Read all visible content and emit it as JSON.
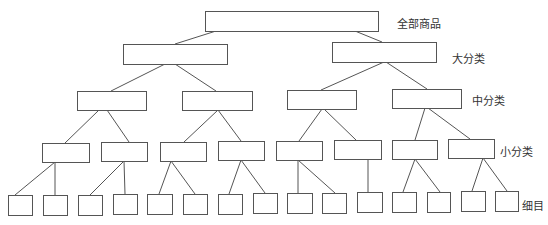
{
  "diagram": {
    "type": "tree",
    "colors": {
      "stroke": "#555555",
      "background": "#ffffff",
      "text": "#333333"
    },
    "levels": [
      {
        "label": "全部商品",
        "label_pos": [
          397,
          15
        ]
      },
      {
        "label": "大分类",
        "label_pos": [
          452,
          50
        ]
      },
      {
        "label": "中分类",
        "label_pos": [
          472,
          92
        ]
      },
      {
        "label": "小分类",
        "label_pos": [
          500,
          143
        ]
      },
      {
        "label": "细目",
        "label_pos": [
          522,
          197
        ]
      }
    ],
    "nodes": {
      "level0": [
        [
          205,
          11,
          173,
          20
        ]
      ],
      "level1": [
        [
          123,
          44,
          104,
          20
        ],
        [
          332,
          42,
          104,
          20
        ]
      ],
      "level2": [
        [
          77,
          91,
          69,
          19
        ],
        [
          182,
          91,
          70,
          19
        ],
        [
          287,
          90,
          69,
          19
        ],
        [
          392,
          89,
          69,
          19
        ]
      ],
      "level3": [
        [
          42,
          143,
          47,
          19
        ],
        [
          101,
          142,
          46,
          19
        ],
        [
          160,
          142,
          46,
          19
        ],
        [
          218,
          141,
          46,
          19
        ],
        [
          276,
          141,
          46,
          19
        ],
        [
          334,
          140,
          47,
          19
        ],
        [
          392,
          140,
          45,
          19
        ],
        [
          448,
          139,
          46,
          19
        ]
      ],
      "level4": [
        [
          8,
          195,
          24,
          20
        ],
        [
          43,
          195,
          24,
          20
        ],
        [
          78,
          195,
          24,
          20
        ],
        [
          113,
          194,
          24,
          20
        ],
        [
          147,
          194,
          25,
          20
        ],
        [
          183,
          194,
          24,
          20
        ],
        [
          218,
          194,
          24,
          20
        ],
        [
          253,
          193,
          24,
          20
        ],
        [
          287,
          193,
          25,
          20
        ],
        [
          322,
          193,
          24,
          20
        ],
        [
          357,
          192,
          25,
          20
        ],
        [
          392,
          192,
          24,
          20
        ],
        [
          427,
          192,
          23,
          20
        ],
        [
          461,
          191,
          24,
          20
        ],
        [
          495,
          191,
          23,
          20
        ]
      ]
    },
    "edges": [
      [
        216,
        31,
        175,
        44
      ],
      [
        355,
        31,
        382,
        42
      ],
      [
        165,
        64,
        111,
        91
      ],
      [
        175,
        64,
        216,
        91
      ],
      [
        384,
        62,
        321,
        90
      ],
      [
        386,
        62,
        427,
        89
      ],
      [
        99,
        110,
        65,
        143
      ],
      [
        107,
        110,
        129,
        142
      ],
      [
        218,
        110,
        184,
        142
      ],
      [
        218,
        110,
        241,
        141
      ],
      [
        322,
        109,
        299,
        141
      ],
      [
        324,
        109,
        356,
        140
      ],
      [
        425,
        108,
        415,
        140
      ],
      [
        428,
        108,
        470,
        139
      ],
      [
        55,
        162,
        15,
        195
      ],
      [
        55,
        162,
        55,
        195
      ],
      [
        124,
        161,
        90,
        195
      ],
      [
        124,
        161,
        125,
        194
      ],
      [
        171,
        161,
        159,
        194
      ],
      [
        171,
        161,
        195,
        194
      ],
      [
        241,
        160,
        229,
        194
      ],
      [
        241,
        160,
        265,
        193
      ],
      [
        298,
        160,
        298,
        193
      ],
      [
        298,
        160,
        335,
        193
      ],
      [
        368,
        159,
        368,
        192
      ],
      [
        415,
        159,
        403,
        192
      ],
      [
        415,
        159,
        440,
        192
      ],
      [
        483,
        158,
        472,
        191
      ],
      [
        483,
        158,
        507,
        191
      ]
    ]
  }
}
